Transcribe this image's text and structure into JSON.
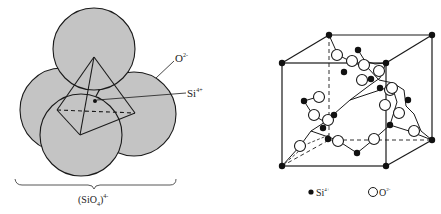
{
  "left_figure": {
    "title": "SiO4 tetrahedron",
    "labels": {
      "oxygen": "O",
      "oxygen_charge": "2-",
      "silicon": "Si",
      "silicon_charge": "4+",
      "formula_open": "(SiO",
      "formula_sub": "4",
      "formula_close": ")",
      "formula_charge": "4-"
    },
    "colors": {
      "sphere_fill": "#c4c4c4",
      "stroke": "#1a1a1a"
    }
  },
  "right_figure": {
    "title": "Cristobalite unit cell",
    "legend": [
      {
        "symbol": "filled-dot",
        "label": "Si",
        "charge": "4+"
      },
      {
        "symbol": "open-circle",
        "label": "O",
        "charge": "2-"
      }
    ],
    "colors": {
      "si_fill": "#111111",
      "o_fill": "#ffffff",
      "stroke": "#1a1a1a"
    }
  }
}
